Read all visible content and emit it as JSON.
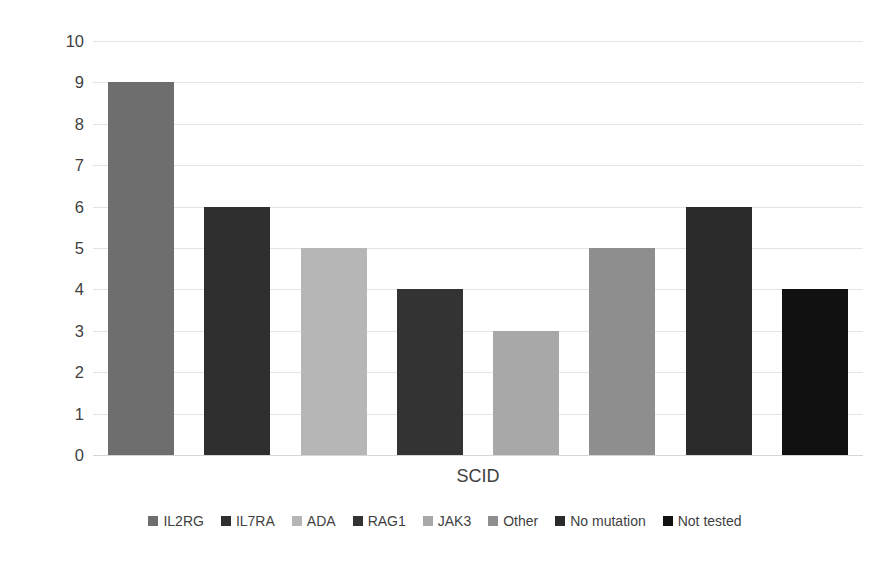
{
  "chart_data": {
    "type": "bar",
    "title": "",
    "xlabel": "SCID",
    "ylabel": "Number of Infants",
    "categories": [
      "IL2RG",
      "IL7RA",
      "ADA",
      "RAG1",
      "JAK3",
      "Other",
      "No mutation",
      "Not tested"
    ],
    "values": [
      9,
      6,
      5,
      4,
      3,
      5,
      6,
      4
    ],
    "colors": [
      "#6e6e6e",
      "#2f2f2f",
      "#b6b6b6",
      "#333333",
      "#a8a8a8",
      "#8e8e8e",
      "#2a2a2a",
      "#111111"
    ],
    "ylim": [
      0,
      10
    ],
    "ytick_labels": [
      "10",
      "9",
      "8",
      "7",
      "6",
      "5",
      "4",
      "3",
      "2",
      "1",
      "0"
    ],
    "ytick_values": [
      10,
      9,
      8,
      7,
      6,
      5,
      4,
      3,
      2,
      1,
      0
    ],
    "grid": true,
    "legend_position": "bottom",
    "legend": [
      {
        "label": "IL2RG",
        "color": "#6e6e6e"
      },
      {
        "label": "IL7RA",
        "color": "#2f2f2f"
      },
      {
        "label": "ADA",
        "color": "#b6b6b6"
      },
      {
        "label": "RAG1",
        "color": "#333333"
      },
      {
        "label": "JAK3",
        "color": "#a8a8a8"
      },
      {
        "label": "Other",
        "color": "#8e8e8e"
      },
      {
        "label": "No mutation",
        "color": "#2a2a2a"
      },
      {
        "label": "Not tested",
        "color": "#111111"
      }
    ]
  }
}
